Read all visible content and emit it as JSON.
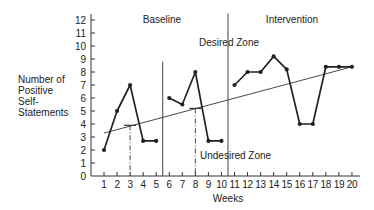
{
  "chart_data": {
    "type": "line",
    "title": "",
    "xlabel": "Weeks",
    "ylabel": [
      "Number of",
      "Positive",
      "Self-",
      "Statements"
    ],
    "x": [
      1,
      2,
      3,
      4,
      5,
      6,
      7,
      8,
      9,
      10,
      11,
      12,
      13,
      14,
      15,
      16,
      17,
      18,
      19,
      20
    ],
    "yticks": [
      0,
      1,
      2,
      3,
      4,
      5,
      6,
      7,
      8,
      9,
      10,
      11,
      12
    ],
    "ylim": [
      0,
      12
    ],
    "xlim": [
      0.5,
      20.5
    ],
    "series": [
      {
        "name": "Baseline A",
        "x": [
          1,
          2,
          3,
          4,
          5
        ],
        "values": [
          2,
          5,
          7,
          2.7,
          2.7
        ]
      },
      {
        "name": "Baseline B",
        "x": [
          6,
          7,
          8,
          9,
          10
        ],
        "values": [
          6,
          5.5,
          8,
          2.7,
          2.7
        ]
      },
      {
        "name": "Intervention",
        "x": [
          11,
          12,
          13,
          14,
          15,
          16,
          17,
          18,
          19,
          20
        ],
        "values": [
          7,
          8,
          8,
          9.2,
          8.2,
          4,
          4,
          8.4,
          8.4,
          8.4
        ]
      }
    ],
    "trend_line": {
      "x": [
        1,
        20
      ],
      "y": [
        3.3,
        8.4
      ]
    },
    "dashed_markers": [
      {
        "x": 3,
        "y": 3.9
      },
      {
        "x": 8,
        "y": 5.2
      }
    ],
    "phase_lines": [
      {
        "x": 5.5,
        "ymax": 8.8
      },
      {
        "x": 10.5,
        "ymax": 12.5
      }
    ],
    "annotations": [
      {
        "text": "Baseline"
      },
      {
        "text": "Intervention"
      },
      {
        "text": "Desired Zone"
      },
      {
        "text": "Undesired Zone"
      }
    ],
    "grid": false
  }
}
